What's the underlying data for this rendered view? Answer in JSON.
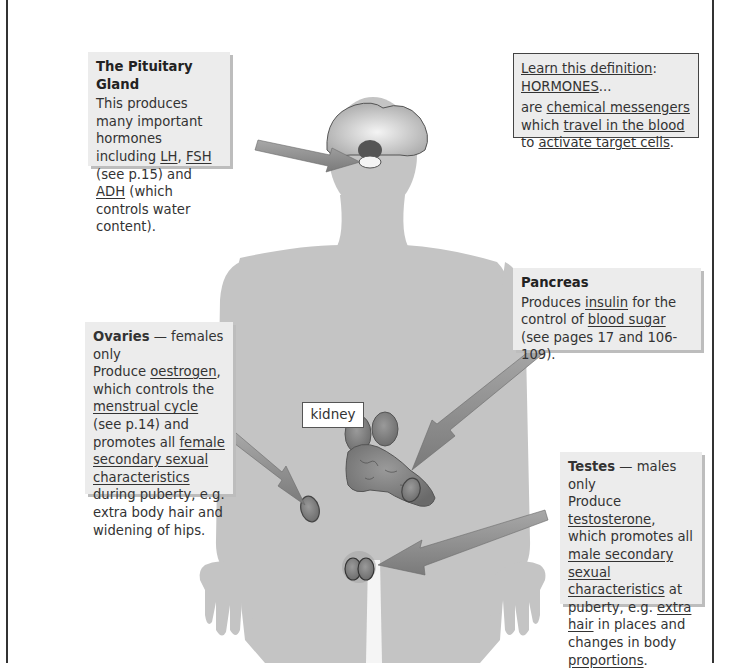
{
  "colors": {
    "body_silhouette": "#c4c4c4",
    "box_background": "#ececec",
    "box_shadow": "#bdbdbd",
    "arrow": "#8a8a8a",
    "frame": "#333333"
  },
  "pituitary": {
    "title": "The Pituitary Gland",
    "text_1": "This produces many important hormones including ",
    "lh": "LH",
    "comma": ", ",
    "fsh": "FSH",
    "text_2": " (see p.15) and ",
    "adh": "ADH",
    "text_3": " (which controls water content)."
  },
  "definition": {
    "intro": "Learn this definition",
    "colon": ":",
    "term": "HORMONES",
    "ellipsis": "...",
    "are": "are ",
    "chem": "chemical messengers",
    "which": "which ",
    "travel": "travel in the blood",
    "to": "to ",
    "activate": "activate target cells",
    "period": "."
  },
  "pancreas": {
    "title": "Pancreas",
    "text_1": "Produces ",
    "insulin": "insulin",
    "text_2": " for the control of ",
    "blood_sugar": "blood sugar",
    "text_3": " (see pages 17 and 106-109)."
  },
  "ovaries": {
    "title": "Ovaries",
    "subtitle": " — females only",
    "text_1": "Produce ",
    "oestrogen": "oestrogen",
    "text_2": ", which controls the ",
    "cycle": "menstrual cycle",
    "text_3": " (see p.14) and promotes all ",
    "female_chars": "female secondary sexual characteristics",
    "text_4": " during puberty, e.g. extra body hair and widening of hips."
  },
  "testes": {
    "title": "Testes",
    "subtitle": " — males only",
    "text_1": "Produce ",
    "testosterone": "testosterone",
    "text_2": ", which promotes all ",
    "male_chars": "male secondary sexual characteristics",
    "text_3": " at puberty, e.g. ",
    "extra_hair": "extra hair",
    "text_4": " in places and changes in body ",
    "proportions": "proportions",
    "text_5": "."
  },
  "labels": {
    "kidney": "kidney"
  }
}
